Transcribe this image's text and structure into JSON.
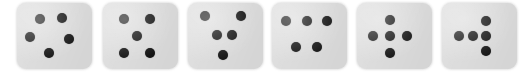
{
  "image": {
    "title": "Six dice faces showing five-pip patterns",
    "width": 530,
    "height": 73,
    "background_color": "#ffffff"
  },
  "style": {
    "die_face_color": "#dcdcdc",
    "pip_color": "#151515",
    "die_corner_radius": 9
  },
  "dice": [
    {
      "name": "die-1",
      "pip_count": 5,
      "arrangement": "pentagon",
      "x": 17,
      "y": 3,
      "width": 75,
      "height": 66,
      "pip_diameter": 10,
      "pips": [
        {
          "name": "pip-top-left",
          "cx": 30,
          "cy": 24
        },
        {
          "name": "pip-top-right",
          "cx": 60,
          "cy": 23
        },
        {
          "name": "pip-middle-left",
          "cx": 17,
          "cy": 52
        },
        {
          "name": "pip-middle-right",
          "cx": 69,
          "cy": 55
        },
        {
          "name": "pip-bottom",
          "cx": 43,
          "cy": 75
        }
      ]
    },
    {
      "name": "die-2",
      "pip_count": 5,
      "arrangement": "quincunx",
      "x": 103,
      "y": 3,
      "width": 75,
      "height": 66,
      "pip_diameter": 10,
      "pips": [
        {
          "name": "pip-top-left",
          "cx": 28,
          "cy": 24
        },
        {
          "name": "pip-top-right",
          "cx": 62,
          "cy": 24
        },
        {
          "name": "pip-center",
          "cx": 45,
          "cy": 50
        },
        {
          "name": "pip-bottom-left",
          "cx": 28,
          "cy": 76
        },
        {
          "name": "pip-bottom-right",
          "cx": 62,
          "cy": 76
        }
      ]
    },
    {
      "name": "die-3",
      "pip_count": 5,
      "arrangement": "pentagon-tilted",
      "x": 188,
      "y": 3,
      "width": 75,
      "height": 66,
      "pip_diameter": 10,
      "pips": [
        {
          "name": "pip-top-left",
          "cx": 23,
          "cy": 19
        },
        {
          "name": "pip-top-right",
          "cx": 70,
          "cy": 19
        },
        {
          "name": "pip-middle-left",
          "cx": 38,
          "cy": 49
        },
        {
          "name": "pip-middle-right",
          "cx": 59,
          "cy": 49
        },
        {
          "name": "pip-bottom",
          "cx": 46,
          "cy": 79
        }
      ]
    },
    {
      "name": "die-4",
      "pip_count": 5,
      "arrangement": "three-over-two",
      "x": 272,
      "y": 3,
      "width": 75,
      "height": 66,
      "pip_diameter": 10,
      "pips": [
        {
          "name": "pip-top-left",
          "cx": 19,
          "cy": 27
        },
        {
          "name": "pip-top-center",
          "cx": 46,
          "cy": 27
        },
        {
          "name": "pip-top-right",
          "cx": 73,
          "cy": 27
        },
        {
          "name": "pip-bottom-left",
          "cx": 32,
          "cy": 67
        },
        {
          "name": "pip-bottom-right",
          "cx": 60,
          "cy": 67
        }
      ]
    },
    {
      "name": "die-5",
      "pip_count": 5,
      "arrangement": "plus-cross",
      "x": 357,
      "y": 3,
      "width": 75,
      "height": 66,
      "pip_diameter": 10,
      "pips": [
        {
          "name": "pip-top",
          "cx": 44,
          "cy": 25
        },
        {
          "name": "pip-left",
          "cx": 21,
          "cy": 50
        },
        {
          "name": "pip-center",
          "cx": 44,
          "cy": 50
        },
        {
          "name": "pip-right",
          "cx": 66,
          "cy": 50
        },
        {
          "name": "pip-bottom",
          "cx": 44,
          "cy": 76
        }
      ]
    },
    {
      "name": "die-6",
      "pip_count": 5,
      "arrangement": "row-with-vertical-pair",
      "x": 442,
      "y": 3,
      "width": 75,
      "height": 66,
      "pip_diameter": 10,
      "pips": [
        {
          "name": "pip-row-left",
          "cx": 23,
          "cy": 50
        },
        {
          "name": "pip-row-center",
          "cx": 41,
          "cy": 50
        },
        {
          "name": "pip-row-right",
          "cx": 58,
          "cy": 50
        },
        {
          "name": "pip-upper",
          "cx": 58,
          "cy": 27
        },
        {
          "name": "pip-lower",
          "cx": 58,
          "cy": 73
        }
      ]
    }
  ]
}
